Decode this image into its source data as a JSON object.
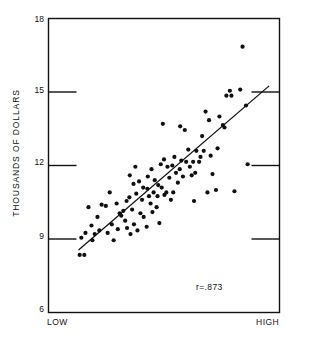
{
  "chart_data": {
    "type": "scatter",
    "title": "",
    "xlabel": "INSTITUTIONAL RATINGS",
    "ylabel": "THOUSANDS OF DOLLARS",
    "xlim": [
      0,
      100
    ],
    "ylim": [
      6,
      18
    ],
    "grid": false,
    "legend": null,
    "x_tick_labels": [
      "LOW",
      "HIGH"
    ],
    "y_tick_labels": [
      "18",
      "15",
      "12",
      "9",
      "6"
    ],
    "y_ticks": [
      18,
      15,
      12,
      9,
      6
    ],
    "annotations": [
      {
        "text": "r=.873",
        "x": 62,
        "y": 7.2
      }
    ],
    "correlation": 0.873,
    "trendline": {
      "type": "linear",
      "x0": 13.0,
      "y0": 8.55,
      "x1": 95.5,
      "y1": 15.25
    },
    "series": [
      {
        "name": "observations",
        "marker": "filled-circle",
        "color": "#101010",
        "points": [
          [
            13.5,
            8.35
          ],
          [
            15.5,
            8.35
          ],
          [
            14.2,
            9.05
          ],
          [
            16.0,
            9.25
          ],
          [
            18.6,
            9.55
          ],
          [
            17.3,
            10.3
          ],
          [
            21.2,
            9.9
          ],
          [
            23.0,
            10.4
          ],
          [
            24.8,
            10.35
          ],
          [
            22.0,
            9.35
          ],
          [
            25.6,
            9.25
          ],
          [
            27.4,
            9.6
          ],
          [
            28.2,
            8.95
          ],
          [
            30.0,
            9.4
          ],
          [
            31.5,
            9.95
          ],
          [
            30.8,
            10.05
          ],
          [
            32.4,
            10.15
          ],
          [
            33.2,
            9.75
          ],
          [
            34.0,
            9.45
          ],
          [
            35.5,
            9.2
          ],
          [
            33.8,
            10.55
          ],
          [
            35.0,
            10.7
          ],
          [
            36.2,
            10.2
          ],
          [
            37.0,
            9.6
          ],
          [
            38.5,
            9.35
          ],
          [
            39.8,
            10.05
          ],
          [
            38.0,
            10.85
          ],
          [
            36.8,
            11.25
          ],
          [
            35.2,
            11.6
          ],
          [
            37.6,
            11.95
          ],
          [
            39.2,
            11.35
          ],
          [
            40.5,
            10.6
          ],
          [
            41.2,
            9.9
          ],
          [
            42.5,
            9.5
          ],
          [
            41.0,
            11.1
          ],
          [
            42.8,
            11.05
          ],
          [
            43.5,
            10.75
          ],
          [
            44.2,
            10.45
          ],
          [
            45.0,
            10.1
          ],
          [
            43.0,
            11.55
          ],
          [
            44.6,
            11.85
          ],
          [
            46.0,
            11.4
          ],
          [
            45.5,
            10.9
          ],
          [
            47.2,
            10.75
          ],
          [
            46.8,
            10.3
          ],
          [
            48.0,
            9.65
          ],
          [
            47.5,
            11.2
          ],
          [
            49.0,
            11.1
          ],
          [
            50.2,
            10.8
          ],
          [
            48.6,
            12.05
          ],
          [
            50.0,
            12.25
          ],
          [
            51.5,
            11.95
          ],
          [
            52.3,
            11.5
          ],
          [
            51.0,
            10.9
          ],
          [
            53.0,
            10.6
          ],
          [
            49.5,
            13.7
          ],
          [
            54.5,
            12.35
          ],
          [
            53.6,
            12.0
          ],
          [
            55.2,
            11.7
          ],
          [
            56.0,
            11.3
          ],
          [
            54.0,
            10.9
          ],
          [
            57.5,
            12.2
          ],
          [
            56.8,
            11.85
          ],
          [
            58.2,
            11.55
          ],
          [
            57.0,
            13.6
          ],
          [
            59.0,
            13.45
          ],
          [
            60.5,
            12.65
          ],
          [
            59.6,
            12.15
          ],
          [
            61.2,
            11.95
          ],
          [
            62.0,
            11.6
          ],
          [
            63.5,
            11.7
          ],
          [
            62.6,
            12.15
          ],
          [
            64.0,
            12.6
          ],
          [
            65.2,
            12.15
          ],
          [
            63.0,
            10.55
          ],
          [
            66.5,
            13.2
          ],
          [
            65.8,
            12.35
          ],
          [
            67.2,
            12.6
          ],
          [
            68.0,
            14.2
          ],
          [
            69.5,
            13.85
          ],
          [
            70.2,
            12.4
          ],
          [
            71.0,
            11.65
          ],
          [
            68.8,
            10.9
          ],
          [
            72.5,
            11.0
          ],
          [
            73.2,
            12.7
          ],
          [
            74.0,
            14.0
          ],
          [
            75.5,
            13.65
          ],
          [
            76.2,
            13.55
          ],
          [
            77.0,
            14.85
          ],
          [
            78.5,
            15.05
          ],
          [
            79.2,
            14.85
          ],
          [
            80.5,
            10.95
          ],
          [
            83.0,
            15.1
          ],
          [
            85.5,
            14.45
          ],
          [
            86.2,
            12.05
          ],
          [
            84.0,
            16.85
          ],
          [
            29.5,
            10.45
          ],
          [
            26.5,
            10.9
          ],
          [
            20.0,
            9.2
          ],
          [
            19.0,
            8.95
          ]
        ]
      }
    ]
  },
  "axes": {
    "y_title": "THOUSANDS OF DOLLARS",
    "x_title": "INSTITUTIONAL RATINGS",
    "x_low_label": "LOW",
    "x_high_label": "HIGH",
    "ticks": {
      "t18": "18",
      "t15": "15",
      "t12": "12",
      "t9": "9",
      "t6": "6"
    }
  },
  "annotation": {
    "correlation_text": "r=.873"
  }
}
